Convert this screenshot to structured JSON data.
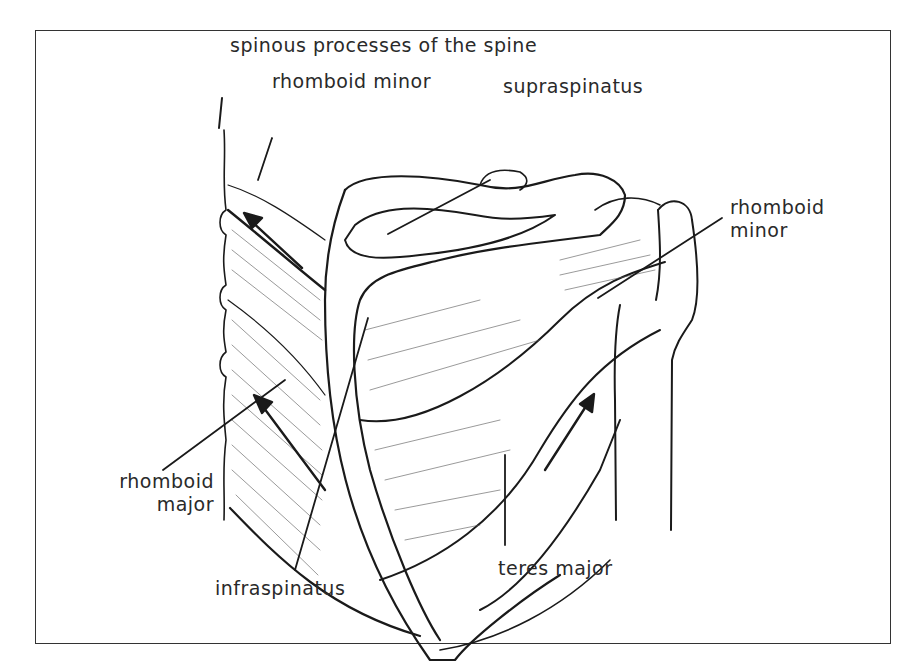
{
  "figure": {
    "labels": {
      "spinous_processes": "spinous processes of the spine",
      "rhomboid_minor_top": "rhomboid minor",
      "supraspinatus": "supraspinatus",
      "rhomboid_minor_right_line1": "rhomboid",
      "rhomboid_minor_right_line2": "minor",
      "rhomboid_major_line1": "rhomboid",
      "rhomboid_major_line2": "major",
      "infraspinatus": "infraspinatus",
      "teres_major": "teres major"
    },
    "colors": {
      "ink": "#1a1a1a",
      "background": "#ffffff",
      "frame": "#333333"
    }
  }
}
